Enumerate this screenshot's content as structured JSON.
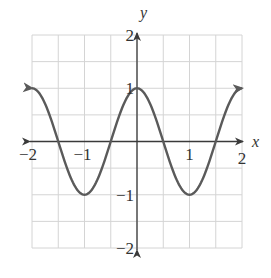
{
  "chart_data": {
    "type": "line",
    "title": "",
    "function": "y = cos(pi x)",
    "xlabel": "x",
    "ylabel": "y",
    "xlim": [
      -2,
      2
    ],
    "ylim": [
      -2,
      2
    ],
    "grid": true,
    "grid_step": 0.5,
    "x_ticks": [
      {
        "value": -2,
        "label": "−2"
      },
      {
        "value": -1,
        "label": "−1"
      },
      {
        "value": 1,
        "label": "1"
      },
      {
        "value": 2,
        "label": "2"
      }
    ],
    "y_ticks": [
      {
        "value": 2,
        "label": "2"
      },
      {
        "value": 1,
        "label": "1"
      },
      {
        "value": -1,
        "label": "−1"
      },
      {
        "value": -2,
        "label": "−2"
      }
    ],
    "series": [
      {
        "name": "cos(pi x)",
        "x": [
          -2,
          -1.5,
          -1,
          -0.5,
          0,
          0.5,
          1,
          1.5,
          2
        ],
        "y": [
          1,
          0,
          -1,
          0,
          1,
          0,
          -1,
          0,
          1
        ],
        "arrows_at_ends": true
      }
    ]
  }
}
